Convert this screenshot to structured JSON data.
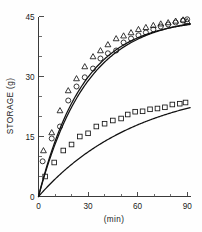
{
  "chart_data": {
    "type": "scatter",
    "title": "",
    "xlabel": "(min)",
    "ylabel": "STORAGE (g)",
    "xlim": [
      0,
      92
    ],
    "ylim": [
      0,
      45
    ],
    "xticks": [
      0,
      30,
      60,
      90
    ],
    "xticklabels": [
      "0",
      "30",
      "60",
      "90"
    ],
    "yticks": [
      0,
      15,
      30,
      45
    ],
    "yticklabels": [
      "0",
      "15",
      "30",
      "45"
    ],
    "x_minor_tick_step": 10,
    "y_minor_tick_step": 5,
    "grid": false,
    "legend": "none",
    "frame": "left-bottom-spines",
    "series": [
      {
        "name": "triangles",
        "marker": "triangle-up",
        "filled": false,
        "points": [
          [
            3.0,
            11.5
          ],
          [
            8.0,
            16.0
          ],
          [
            13.0,
            21.5
          ],
          [
            18.0,
            26.5
          ],
          [
            23.0,
            29.5
          ],
          [
            28.0,
            32.5
          ],
          [
            33.0,
            35.0
          ],
          [
            37.5,
            36.5
          ],
          [
            42.0,
            38.0
          ],
          [
            47.0,
            39.5
          ],
          [
            51.5,
            40.2
          ],
          [
            56.0,
            41.0
          ],
          [
            60.5,
            41.8
          ],
          [
            65.0,
            42.3
          ],
          [
            69.5,
            42.8
          ],
          [
            74.0,
            43.2
          ],
          [
            78.5,
            43.5
          ],
          [
            83.0,
            43.9
          ],
          [
            87.5,
            44.2
          ],
          [
            90.0,
            43.8
          ]
        ]
      },
      {
        "name": "circles",
        "marker": "circle",
        "filled": false,
        "points": [
          [
            2.5,
            8.8
          ],
          [
            8.0,
            14.5
          ],
          [
            13.0,
            17.5
          ],
          [
            18.0,
            24.0
          ],
          [
            23.0,
            27.5
          ],
          [
            28.0,
            29.8
          ],
          [
            33.0,
            32.0
          ],
          [
            37.5,
            34.5
          ],
          [
            42.0,
            35.8
          ],
          [
            47.0,
            36.5
          ],
          [
            51.5,
            38.5
          ],
          [
            56.0,
            39.5
          ],
          [
            60.5,
            40.3
          ],
          [
            65.0,
            41.0
          ],
          [
            69.5,
            41.8
          ],
          [
            74.0,
            42.5
          ],
          [
            78.5,
            43.0
          ],
          [
            83.0,
            43.5
          ],
          [
            87.5,
            44.0
          ],
          [
            90.0,
            44.3
          ]
        ]
      },
      {
        "name": "squares",
        "marker": "square",
        "filled": false,
        "points": [
          [
            4.0,
            5.0
          ],
          [
            9.5,
            8.5
          ],
          [
            15.0,
            11.5
          ],
          [
            20.0,
            13.0
          ],
          [
            25.0,
            15.0
          ],
          [
            30.0,
            15.8
          ],
          [
            35.0,
            17.5
          ],
          [
            40.0,
            18.2
          ],
          [
            45.0,
            19.0
          ],
          [
            50.0,
            19.5
          ],
          [
            54.0,
            20.5
          ],
          [
            58.5,
            21.2
          ],
          [
            63.0,
            21.3
          ],
          [
            67.5,
            21.8
          ],
          [
            72.0,
            22.0
          ],
          [
            76.5,
            22.3
          ],
          [
            81.0,
            23.0
          ],
          [
            85.5,
            23.2
          ],
          [
            89.0,
            23.5
          ]
        ]
      }
    ],
    "fit_curves": [
      {
        "name": "upper-fit-a",
        "description": "saturating exponential fit through triangle/circle data",
        "plateau": 44.5,
        "rate_constant": 0.037
      },
      {
        "name": "upper-fit-b",
        "description": "second nearly coincident saturating fit",
        "plateau": 45.2,
        "rate_constant": 0.034
      },
      {
        "name": "lower-fit",
        "description": "saturating exponential fit through square data",
        "plateau": 28.5,
        "rate_constant": 0.0165
      }
    ]
  }
}
